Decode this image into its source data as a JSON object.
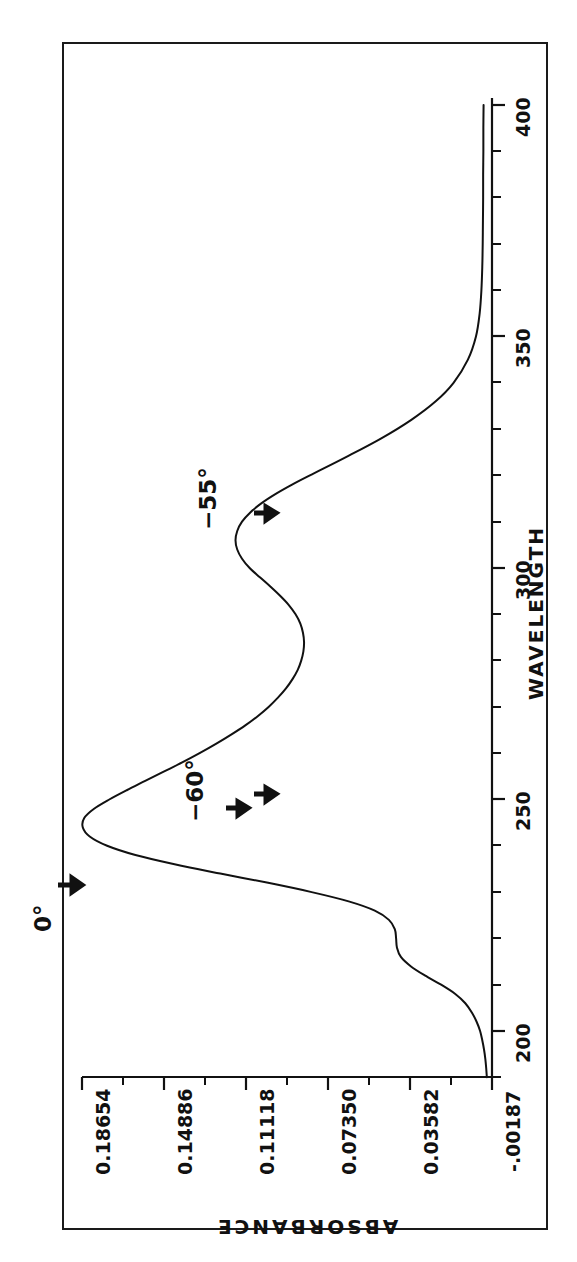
{
  "figure": {
    "kind": "uv-vis-absorbance-spectrum",
    "orientation": "rotated-90-ccw"
  },
  "annotations": [
    {
      "name": "0deg",
      "label": "0°",
      "arrows": 1
    },
    {
      "name": "60deg",
      "label": "−60°",
      "arrows": 2
    },
    {
      "name": "55deg",
      "label": "−55°",
      "arrows": 1
    }
  ],
  "axis_titles": {
    "absorbance": "ABSORBANCE",
    "wavelength": "WAVELENGTH"
  },
  "y_tick_labels": [
    "0.18654",
    "0.14886",
    "0.11118",
    "0.07350",
    "0.03582",
    "-.00187"
  ],
  "x_tick_labels": [
    "200",
    "250",
    "300",
    "350",
    "400"
  ],
  "chart_data": {
    "type": "line",
    "title": "",
    "xlabel": "WAVELENGTH",
    "ylabel": "ABSORBANCE",
    "xlim": [
      190,
      400
    ],
    "ylim": [
      -0.00187,
      0.18654
    ],
    "xticks": [
      200,
      250,
      300,
      350,
      400
    ],
    "xtick_labels": [
      "200",
      "250",
      "300",
      "350",
      "400"
    ],
    "yticks": [
      0.18654,
      0.14886,
      0.11118,
      0.0735,
      0.03582,
      -0.00187
    ],
    "ytick_labels": [
      "0.18654",
      "0.14886",
      "0.11118",
      "0.07350",
      "0.03582",
      "-.00187"
    ],
    "minor_tick_interval_x": 10,
    "grid": false,
    "legend": null,
    "series": [
      {
        "name": "absorbance",
        "x": [
          190,
          192,
          194,
          196,
          198,
          200,
          202,
          204,
          206,
          208,
          210,
          212,
          214,
          216,
          218,
          220,
          222,
          224,
          226,
          228,
          230,
          232,
          234,
          236,
          238,
          240,
          242,
          244,
          246,
          248,
          250,
          252,
          254,
          256,
          258,
          260,
          262,
          264,
          266,
          268,
          270,
          272,
          274,
          276,
          278,
          280,
          282,
          284,
          286,
          288,
          290,
          292,
          294,
          296,
          298,
          300,
          302,
          304,
          306,
          308,
          310,
          312,
          314,
          316,
          318,
          320,
          324,
          328,
          332,
          336,
          340,
          345,
          350,
          355,
          360,
          365,
          370,
          375,
          380,
          385,
          390,
          395,
          400
        ],
        "y": [
          0.0005,
          0.0008,
          0.0012,
          0.0018,
          0.0026,
          0.0036,
          0.0052,
          0.0074,
          0.0104,
          0.015,
          0.0215,
          0.029,
          0.0355,
          0.04,
          0.0418,
          0.0422,
          0.0428,
          0.0455,
          0.052,
          0.064,
          0.081,
          0.101,
          0.123,
          0.144,
          0.162,
          0.175,
          0.183,
          0.1862,
          0.1855,
          0.181,
          0.174,
          0.166,
          0.1575,
          0.149,
          0.1405,
          0.1325,
          0.125,
          0.118,
          0.1115,
          0.1058,
          0.1008,
          0.0965,
          0.0928,
          0.0898,
          0.0874,
          0.0858,
          0.0848,
          0.0845,
          0.085,
          0.0862,
          0.0884,
          0.0915,
          0.0955,
          0.1,
          0.1048,
          0.1095,
          0.113,
          0.1152,
          0.116,
          0.1152,
          0.113,
          0.1092,
          0.104,
          0.0975,
          0.09,
          0.0818,
          0.065,
          0.049,
          0.0352,
          0.024,
          0.0158,
          0.0092,
          0.0055,
          0.0038,
          0.003,
          0.0026,
          0.0024,
          0.0023,
          0.0022,
          0.0022,
          0.0021,
          0.0021,
          0.002
        ]
      }
    ],
    "annotations": [
      {
        "text": "0°",
        "x": 244,
        "y": 0.1862
      },
      {
        "text": "−60°",
        "x": 252,
        "y": 0.174
      },
      {
        "text": "−55°",
        "x": 311,
        "y": 0.113
      }
    ]
  }
}
